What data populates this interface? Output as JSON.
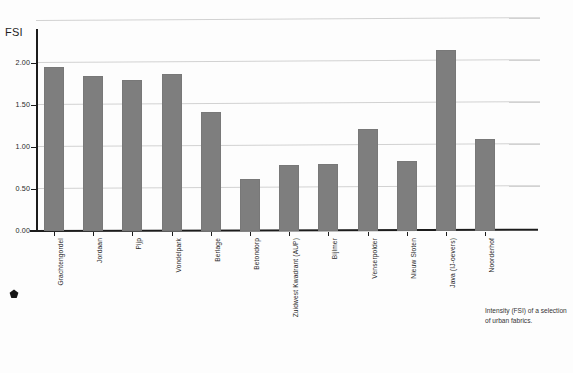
{
  "chart_data": {
    "type": "bar",
    "title": "",
    "ylabel": "FSI",
    "xlabel": "",
    "ylim": [
      0.0,
      2.5
    ],
    "yticks": [
      "0.00",
      "0.50",
      "1.00",
      "1.50",
      "2.00"
    ],
    "ytick_values": [
      0.0,
      0.5,
      1.0,
      1.5,
      2.0
    ],
    "grid": true,
    "gridlines_at": [
      0.5,
      1.0,
      1.5,
      2.0,
      2.5
    ],
    "legend": "none",
    "bar_color": "#7e7e7e",
    "categories": [
      "Grachtengordel",
      "Jordaan",
      "Pijp",
      "Vondelpark",
      "Berlage",
      "Betondorp",
      "Zuidwest Kwadrant (AUP)",
      "Bijlmer",
      "Venserpolder",
      "Nieuw Sloten",
      "Java (IJ-oevers)",
      "Noorderhof"
    ],
    "values": [
      1.95,
      1.85,
      1.8,
      1.87,
      1.42,
      0.62,
      0.78,
      0.8,
      1.22,
      0.83,
      2.15,
      1.1
    ]
  },
  "caption": {
    "text": "Intensity (FSI) of a selection of urban fabrics."
  },
  "marker": {
    "name": "pentagon-marker"
  }
}
